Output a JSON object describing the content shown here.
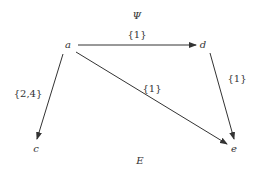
{
  "diagram": {
    "title": "Ψ",
    "footer": "E",
    "nodes": [
      {
        "id": "a",
        "label": "a",
        "x": 68,
        "y": 45
      },
      {
        "id": "d",
        "label": "d",
        "x": 203,
        "y": 45
      },
      {
        "id": "c",
        "label": "c",
        "x": 36,
        "y": 148
      },
      {
        "id": "e",
        "label": "e",
        "x": 234,
        "y": 148
      }
    ],
    "edges": [
      {
        "from": "a",
        "to": "d",
        "label": "{1}"
      },
      {
        "from": "a",
        "to": "c",
        "label": "{2,4}"
      },
      {
        "from": "a",
        "to": "e",
        "label": "{1}"
      },
      {
        "from": "d",
        "to": "e",
        "label": "{1}"
      }
    ],
    "colors": {
      "line": "#333333",
      "text": "#333333"
    }
  }
}
